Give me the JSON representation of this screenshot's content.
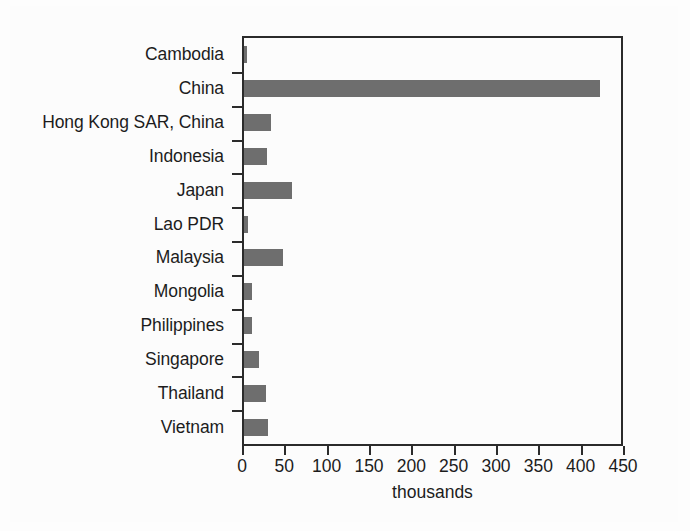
{
  "chart_data": {
    "type": "bar",
    "orientation": "horizontal",
    "title": "",
    "xlabel": "thousands",
    "ylabel": "",
    "xlim": [
      0,
      450
    ],
    "xticks": [
      0,
      50,
      100,
      150,
      200,
      250,
      300,
      350,
      400,
      450
    ],
    "xtick_labels": [
      "0",
      "50",
      "100",
      "150",
      "200",
      "250",
      "300",
      "350",
      "400",
      "450"
    ],
    "grid": false,
    "legend": null,
    "bar_color": "#6e6e6e",
    "axis_color": "#2b2b2b",
    "background_color": "#fdfdfd",
    "categories": [
      "Cambodia",
      "China",
      "Hong Kong SAR, China",
      "Indonesia",
      "Japan",
      "Lao PDR",
      "Malaysia",
      "Mongolia",
      "Philippines",
      "Singapore",
      "Thailand",
      "Vietnam"
    ],
    "values": [
      4,
      420,
      32,
      27,
      57,
      5,
      46,
      9,
      9,
      18,
      26,
      28
    ]
  }
}
